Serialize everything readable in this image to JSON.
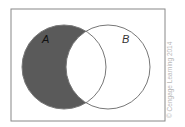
{
  "diagram": {
    "type": "venn",
    "shaded_region": "A minus B",
    "sets": [
      {
        "label": "A",
        "shaded": true
      },
      {
        "label": "B",
        "shaded": false
      }
    ],
    "colors": {
      "shade": "#5a5a5a",
      "stroke": "#777777",
      "frame": "#888888"
    }
  },
  "credit": "© Cengage Learning 2014"
}
